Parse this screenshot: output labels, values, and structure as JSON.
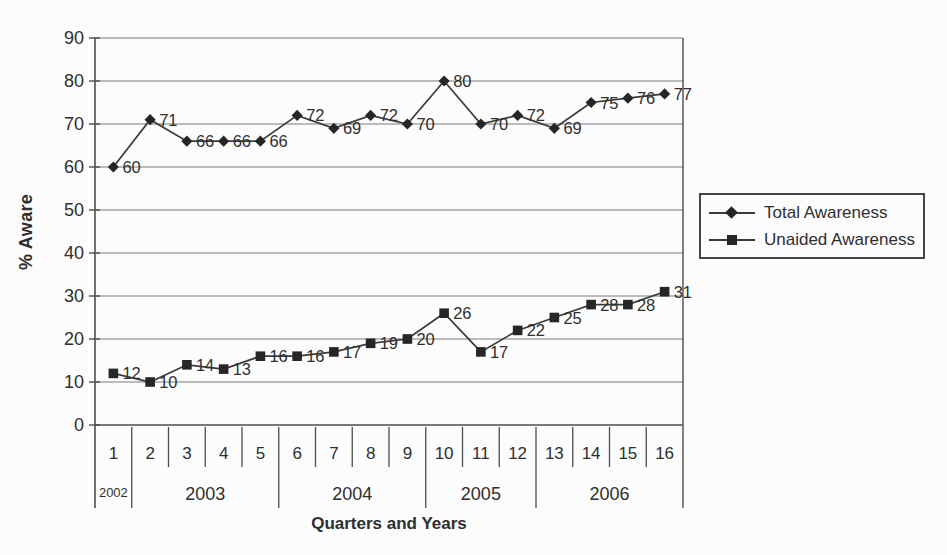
{
  "figure": {
    "background": "#fcfcfc"
  },
  "colors": {
    "series_line": "#3b3b3b",
    "marker_fill": "#262626",
    "gridline": "#7a7a7a",
    "axis": "#4d4d4d",
    "text": "#2f2f2f"
  },
  "chart_data": {
    "type": "line",
    "title": "",
    "xlabel": "Quarters and Years",
    "ylabel": "% Aware",
    "ylim": [
      0,
      90
    ],
    "ytick_step": 10,
    "grid": true,
    "legend_position": "right",
    "categories": [
      "1",
      "2",
      "3",
      "4",
      "5",
      "6",
      "7",
      "8",
      "9",
      "10",
      "11",
      "12",
      "13",
      "14",
      "15",
      "16"
    ],
    "year_groups": [
      {
        "label": "2002",
        "span": 1
      },
      {
        "label": "2003",
        "span": 4
      },
      {
        "label": "2004",
        "span": 4
      },
      {
        "label": "2005",
        "span": 3
      },
      {
        "label": "2006",
        "span": 4
      }
    ],
    "series": [
      {
        "name": "Total Awareness",
        "marker": "diamond",
        "values": [
          60,
          71,
          66,
          66,
          66,
          72,
          69,
          72,
          70,
          80,
          70,
          72,
          69,
          75,
          76,
          77
        ]
      },
      {
        "name": "Unaided Awareness",
        "marker": "square",
        "values": [
          12,
          10,
          14,
          13,
          16,
          16,
          17,
          19,
          20,
          26,
          17,
          22,
          25,
          28,
          28,
          31
        ]
      }
    ]
  }
}
